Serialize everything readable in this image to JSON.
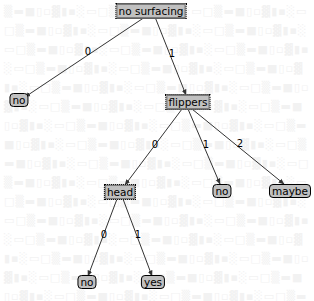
{
  "diagram": {
    "type": "decision-tree",
    "style": {
      "decision_fill": "#c0c0c0",
      "leaf_fill": "#c0c0c0",
      "edge_color": "#333333",
      "background": "#ffffff"
    },
    "nodes": {
      "root": {
        "label": "no surfacing",
        "kind": "decision",
        "x": 151,
        "y": 11
      },
      "leaf_no_1": {
        "label": "no",
        "kind": "leaf",
        "x": 19,
        "y": 100
      },
      "flippers": {
        "label": "flippers",
        "kind": "decision",
        "x": 188,
        "y": 102
      },
      "head": {
        "label": "head",
        "kind": "decision",
        "x": 120,
        "y": 192
      },
      "leaf_no_2": {
        "label": "no",
        "kind": "leaf",
        "x": 222,
        "y": 191
      },
      "leaf_maybe": {
        "label": "maybe",
        "kind": "leaf",
        "x": 290,
        "y": 191
      },
      "leaf_no_3": {
        "label": "no",
        "kind": "leaf",
        "x": 87,
        "y": 282
      },
      "leaf_yes": {
        "label": "yes",
        "kind": "leaf",
        "x": 153,
        "y": 282
      }
    },
    "edges": [
      {
        "from": "root",
        "to": "leaf_no_1",
        "label": "0",
        "lx": 88,
        "ly": 52
      },
      {
        "from": "root",
        "to": "flippers",
        "label": "1",
        "lx": 172,
        "ly": 54
      },
      {
        "from": "flippers",
        "to": "head",
        "label": "0",
        "lx": 155,
        "ly": 145
      },
      {
        "from": "flippers",
        "to": "leaf_no_2",
        "label": "1",
        "lx": 206,
        "ly": 145
      },
      {
        "from": "flippers",
        "to": "leaf_maybe",
        "label": "2",
        "lx": 240,
        "ly": 144
      },
      {
        "from": "head",
        "to": "leaf_no_3",
        "label": "0",
        "lx": 104,
        "ly": 235
      },
      {
        "from": "head",
        "to": "leaf_yes",
        "label": "1",
        "lx": 138,
        "ly": 235
      }
    ]
  }
}
